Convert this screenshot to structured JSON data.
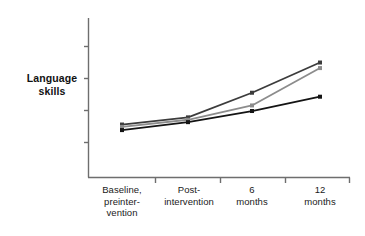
{
  "chart_data": {
    "type": "line",
    "title": "",
    "subtitle": "",
    "xlabel": "",
    "ylabel": "Language skills",
    "ylabel_lines": [
      "Language",
      "skills"
    ],
    "categories": [
      "Baseline, preintervention",
      "Post-intervention",
      "6 months",
      "12 months"
    ],
    "category_label_lines": [
      [
        "Baseline,",
        "preinter-",
        "vention"
      ],
      [
        "Post-",
        "intervention"
      ],
      [
        "6",
        "months"
      ],
      [
        "12",
        "months"
      ]
    ],
    "grid": false,
    "legend": "none",
    "y_axis": {
      "ticks_unlabeled": true,
      "tick_count": 4,
      "range_label": "",
      "ticks": [
        1,
        2,
        3,
        4
      ]
    },
    "series": [
      {
        "name": "series-dark-gray",
        "color": "#3c3c3c",
        "marker": "square",
        "values": [
          3.3,
          3.75,
          5.3,
          7.2
        ]
      },
      {
        "name": "series-medium-gray",
        "color": "#8c8c8c",
        "marker": "square",
        "values": [
          3.15,
          3.6,
          4.5,
          6.85
        ]
      },
      {
        "name": "series-black",
        "color": "#141414",
        "marker": "square",
        "values": [
          2.95,
          3.45,
          4.15,
          5.05
        ]
      }
    ],
    "ylim": [
      0,
      10
    ],
    "xlim": [
      0,
      5
    ]
  },
  "geometry": {
    "axis_x": 88,
    "axis_top": 18,
    "axis_bottom": 177,
    "axis_right": 350,
    "category_x": [
      122,
      188,
      252,
      320
    ],
    "x_tick_x": [
      155,
      220,
      285,
      350
    ],
    "y_tick_y": [
      46,
      78,
      110,
      142
    ]
  }
}
